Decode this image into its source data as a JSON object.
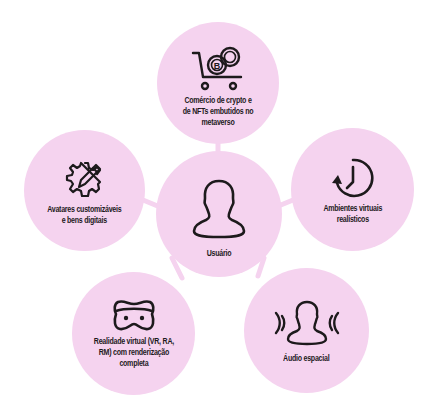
{
  "diagram": {
    "type": "hub-and-spoke",
    "colors": {
      "node_fill": "#f5d3ef",
      "connector": "#f5d3ef",
      "icon_stroke": "#1d1a1c",
      "text": "#1d1a1c",
      "background": "#ffffff"
    },
    "center": {
      "label": "Usuário",
      "icon": "user-icon"
    },
    "nodes": [
      {
        "id": "crypto",
        "label": "Comércio de crypto e\nde NFTs embutidos no\nmetaverso",
        "icon": "cart-crypto-icon"
      },
      {
        "id": "environments",
        "label": "Ambientes virtuais\nrealísticos",
        "icon": "clock-rotate-icon"
      },
      {
        "id": "audio",
        "label": "Áudio espacial",
        "icon": "spatial-audio-user-icon"
      },
      {
        "id": "vr",
        "label": "Realidade virtual (VR, RA,\nRM) com renderização\ncompleta",
        "icon": "vr-headset-icon"
      },
      {
        "id": "avatars",
        "label": "Avatares customizáveis\ne bens digitais",
        "icon": "gear-pencil-icon"
      }
    ]
  }
}
